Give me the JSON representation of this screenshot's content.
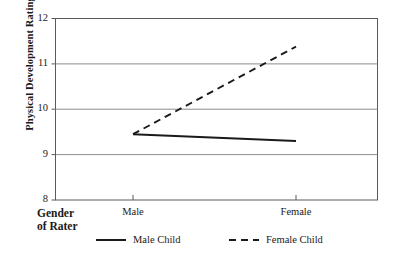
{
  "chart_data": {
    "type": "line",
    "title": "",
    "xlabel": "Gender of Rater",
    "ylabel": "Physical Development Rating",
    "categories": [
      "Male",
      "Female"
    ],
    "xtick_labels": [
      "Male",
      "Female"
    ],
    "ytick_labels": [
      "8",
      "9",
      "10",
      "11",
      "12"
    ],
    "yticks": [
      8,
      9,
      10,
      11,
      12
    ],
    "ylim": [
      8,
      12
    ],
    "grid": "horizontal",
    "legend_position": "below-axis",
    "series": [
      {
        "name": "Male Child",
        "style": "solid",
        "color": "#1a1a1a",
        "values": [
          9.45,
          9.3
        ]
      },
      {
        "name": "Female Child",
        "style": "dashed",
        "color": "#1a1a1a",
        "values": [
          9.45,
          11.38
        ]
      }
    ]
  },
  "axis": {
    "y_title": "Physical Development Rating",
    "x_corner_line1": "Gender",
    "x_corner_line2": "of Rater",
    "ytick_12": "12",
    "ytick_11": "11",
    "ytick_10": "10",
    "ytick_9": "9",
    "ytick_8": "8",
    "xtick_male": "Male",
    "xtick_female": "Female"
  },
  "legend": {
    "entry_solid_label": "Male Child",
    "entry_dashed_label": "Female Child"
  },
  "colors": {
    "ink": "#1a1a1a",
    "gridline": "#808080",
    "frame": "#5a5a5a",
    "background": "#ffffff"
  }
}
